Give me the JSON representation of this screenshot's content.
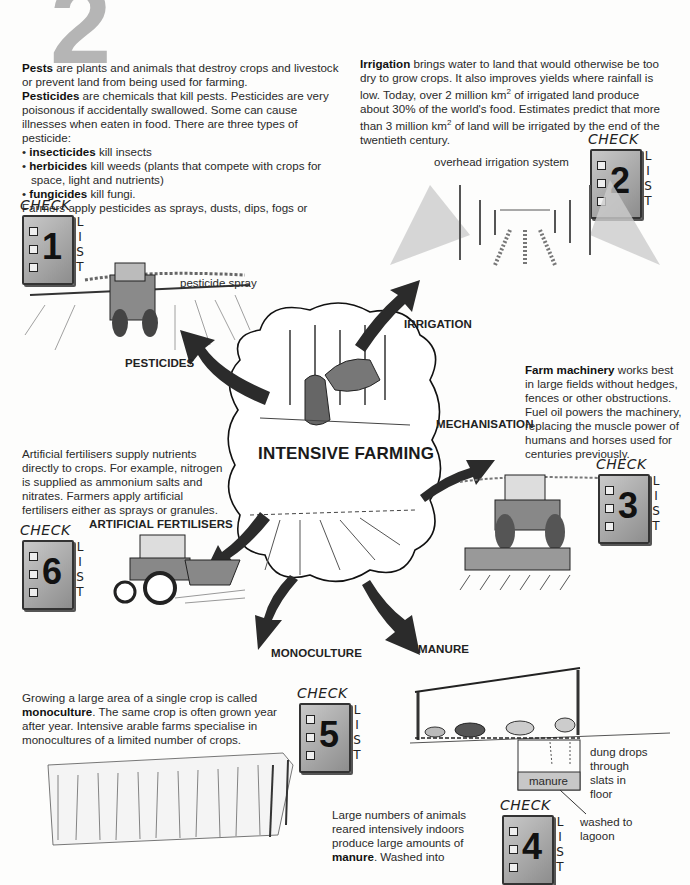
{
  "page": {
    "chapter_number": "2",
    "central_topic": "INTENSIVE FARMING"
  },
  "colors": {
    "text": "#222222",
    "arrow": "#2b2b2b",
    "badge_fill": "#a8a8a8",
    "chapter_number": "#b5b5b5",
    "background": "#fdfdfc"
  },
  "pesticides": {
    "p1_bold": "Pests",
    "p1_rest": " are plants and animals that destroy crops and livestock or prevent land from being used for farming.",
    "p2_bold": "Pesticides",
    "p2_rest": " are chemicals that kill pests. Pesticides are very poisonous if accidentally swallowed. Some can cause illnesses when eaten in food. There are three types of pesticide:",
    "bullets": [
      {
        "term": "insecticides",
        "text": " kill insects"
      },
      {
        "term": "herbicides",
        "text": " kill weeds (plants that compete with crops for space, light and nutrients)"
      },
      {
        "term": "fungicides",
        "text": " kill fungi."
      }
    ],
    "p3": "Farmers apply pesticides as sprays, dusts, dips, fogs or granules.",
    "caption": "pesticide spray",
    "label": "PESTICIDES",
    "checklist_number": "1"
  },
  "irrigation": {
    "p_bold": "Irrigation",
    "p_line1": " brings water to land that would otherwise be too dry to grow crops. It also improves yields where rainfall is low.",
    "p_line2a": "Today, over 2 million km",
    "sup": "2",
    "p_line2b": " of irrigated land produce about 30% of the world's food. Estimates predict that more than 3 million km",
    "p_line2c": " of land will be irrigated by the end of the twentieth century.",
    "caption": "overhead irrigation system",
    "label": "IRRIGATION",
    "checklist_number": "2"
  },
  "mechanisation": {
    "p_bold": "Farm machinery",
    "p_rest": " works best in large fields without hedges, fences or other obstructions. Fuel oil powers the machinery, replacing the muscle power of humans and horses used for centuries previously.",
    "label": "MECHANISATION",
    "checklist_number": "3"
  },
  "fertilisers": {
    "p": "Artificial fertilisers supply nutrients directly to crops. For example, nitrogen is supplied as ammonium salts and nitrates. Farmers apply artificial fertilisers either as sprays or granules.",
    "label": "ARTIFICIAL FERTILISERS",
    "checklist_number": "6"
  },
  "monoculture": {
    "p_a": "Growing a large area of a single crop is called ",
    "p_bold": "monoculture",
    "p_b": ". The same crop is often grown year after year. Intensive arable farms specialise in monocultures of a limited number of crops.",
    "label": "MONOCULTURE",
    "checklist_number": "5"
  },
  "manure": {
    "p_a": "Large numbers of animals reared intensively indoors produce large amounts of ",
    "p_bold": "manure",
    "p_b": ". Washed into",
    "label": "MANURE",
    "caption_dung": "dung drops through slats in floor",
    "caption_pit": "manure",
    "caption_lagoon": "washed to lagoon",
    "checklist_number": "4"
  },
  "checklist": {
    "title": "CHECK",
    "list_letters": [
      "L",
      "I",
      "S",
      "T"
    ]
  }
}
